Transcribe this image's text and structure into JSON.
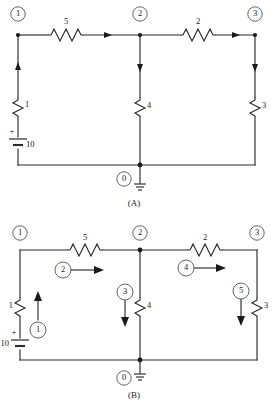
{
  "figure": {
    "panels": [
      {
        "id": "A",
        "caption": "(A)",
        "nodes": [
          {
            "label": "1",
            "cx": 18,
            "cy": 14
          },
          {
            "label": "2",
            "cx": 140,
            "cy": 14
          },
          {
            "label": "3",
            "cx": 255,
            "cy": 14
          },
          {
            "label": "0",
            "cx": 124,
            "cy": 179
          }
        ],
        "resistors": [
          {
            "label": "5",
            "orientation": "horizontal",
            "cx": 66,
            "cy": 35
          },
          {
            "label": "2",
            "orientation": "horizontal",
            "cx": 198,
            "cy": 35
          },
          {
            "label": "1",
            "orientation": "vertical",
            "cx": 18,
            "cy": 107
          },
          {
            "label": "4",
            "orientation": "vertical",
            "cx": 140,
            "cy": 107
          },
          {
            "label": "3",
            "orientation": "vertical",
            "cx": 255,
            "cy": 107
          }
        ],
        "source": {
          "label": "10",
          "type": "battery",
          "polarity": "+",
          "cx": 18,
          "cy": 143
        },
        "ground": {
          "label": "0",
          "cx": 140,
          "cy": 165
        }
      },
      {
        "id": "B",
        "caption": "(B)",
        "nodes": [
          {
            "label": "1",
            "cx": 20,
            "cy": 233
          },
          {
            "label": "2",
            "cx": 140,
            "cy": 233
          },
          {
            "label": "3",
            "cx": 257,
            "cy": 233
          },
          {
            "label": "0",
            "cx": 124,
            "cy": 378
          }
        ],
        "resistors": [
          {
            "label": "5",
            "orientation": "horizontal",
            "cx": 85,
            "cy": 250
          },
          {
            "label": "2",
            "orientation": "horizontal",
            "cx": 205,
            "cy": 250
          },
          {
            "label": "1",
            "orientation": "vertical",
            "cx": 20,
            "cy": 307
          },
          {
            "label": "4",
            "orientation": "vertical",
            "cx": 140,
            "cy": 307
          },
          {
            "label": "3",
            "orientation": "vertical",
            "cx": 257,
            "cy": 307
          }
        ],
        "source": {
          "label": "10",
          "type": "battery",
          "polarity": "+",
          "cx": 20,
          "cy": 344
        },
        "currents": [
          {
            "label": "1",
            "cx": 38,
            "cy": 330,
            "direction": "up"
          },
          {
            "label": "2",
            "cx": 63,
            "cy": 270,
            "direction": "right"
          },
          {
            "label": "3",
            "cx": 125,
            "cy": 292,
            "direction": "down"
          },
          {
            "label": "4",
            "cx": 186,
            "cy": 268,
            "direction": "right"
          },
          {
            "label": "5",
            "cx": 241,
            "cy": 291,
            "direction": "down"
          }
        ],
        "ground": {
          "label": "0",
          "cx": 140,
          "cy": 360
        }
      }
    ],
    "colors": {
      "wire": "#2b2b2b",
      "text": "#1a1a1a",
      "ring": "#555555",
      "background": "#ffffff"
    }
  }
}
